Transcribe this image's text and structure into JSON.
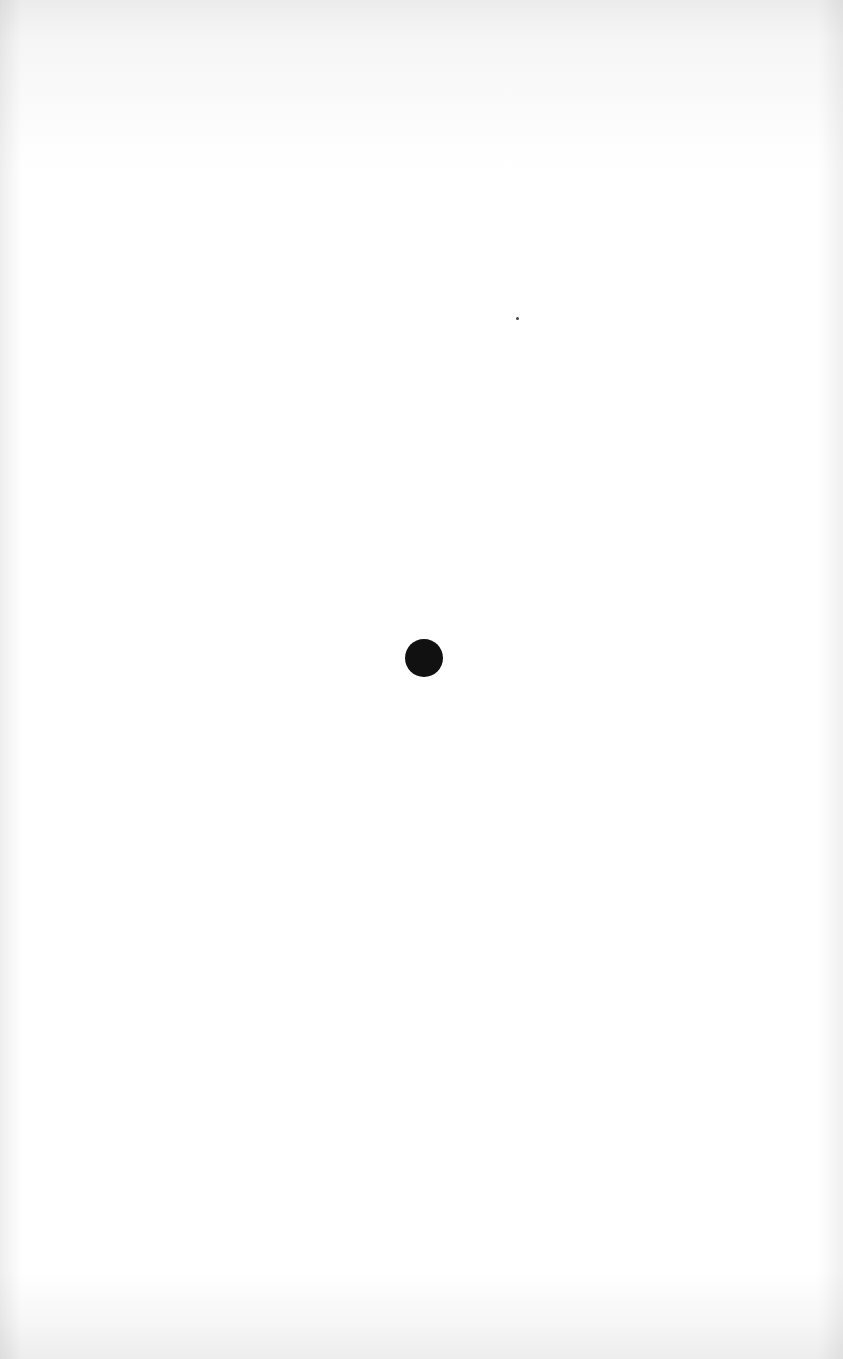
{
  "page": {
    "background_color": "#ffffff"
  },
  "marks": {
    "main_dot": {
      "color": "#111111",
      "center_x": 424,
      "center_y": 658,
      "radius": 19
    },
    "speck": {
      "color": "#444444",
      "x": 517,
      "y": 318
    }
  }
}
